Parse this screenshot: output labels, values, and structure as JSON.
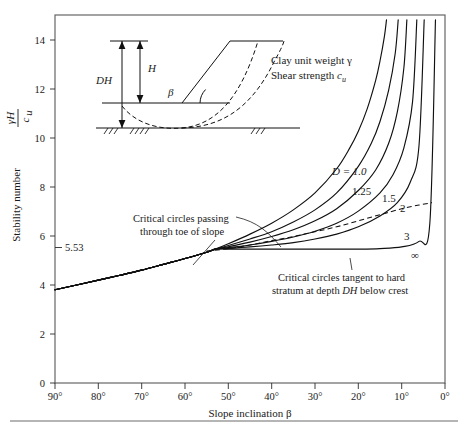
{
  "figure": {
    "kind": "taylor-slope-stability-chart",
    "background": "#ffffff",
    "frame_color": "#58585a",
    "curve_color": "#101010"
  },
  "axes": {
    "y_title_prefix": "Stability number",
    "y_title_numerator": "γH",
    "y_title_denominator": "c",
    "y_title_denominator_sub": "u",
    "x_title": "Slope inclination β",
    "y_ticks": [
      "0",
      "2",
      "4",
      "6",
      "8",
      "10",
      "12",
      "14"
    ],
    "y_tick_values": [
      0,
      2,
      4,
      6,
      8,
      10,
      12,
      14
    ],
    "y_range": [
      0,
      15.2
    ],
    "x_ticks": [
      "90°",
      "80°",
      "70°",
      "60°",
      "50°",
      "40°",
      "30°",
      "20°",
      "10°",
      "0°"
    ],
    "x_tick_values": [
      90,
      80,
      70,
      60,
      50,
      40,
      30,
      20,
      10,
      0
    ],
    "x_range": [
      90,
      0
    ],
    "x_reversed": true,
    "grid": false
  },
  "annotations": {
    "value_553": "5.53",
    "toe_note_line1": "Critical circles passing",
    "toe_note_line2": "through toe of slope",
    "tangent_note_line1": "Critical circles tangent to hard",
    "tangent_note_line2_a": "stratum at depth ",
    "tangent_note_line2_b": "DH",
    "tangent_note_line2_c": " below crest"
  },
  "inset": {
    "label_DH": "DH",
    "label_H": "H",
    "label_beta": "β",
    "text_line1": "Clay unit weight γ",
    "text_line2_a": "Shear strength ",
    "text_line2_b": "c",
    "text_line2_sub": "u"
  },
  "curve_labels": {
    "d1": "D = 1.0",
    "d125": "1.25",
    "d15": "1.5",
    "d2": "2",
    "d3": "3",
    "dinf": "∞"
  },
  "chart_data": {
    "type": "line",
    "title": "",
    "xlabel": "Slope inclination β",
    "ylabel": "Stability number γH/c_u",
    "xlim": [
      90,
      0
    ],
    "ylim": [
      0,
      15.2
    ],
    "x_reversed": true,
    "grid": false,
    "legend_position": "inline-curve-labels",
    "annotations": [
      {
        "text": "5.53",
        "x": 90,
        "y": 5.53,
        "note": "limiting stability number for deep circles"
      },
      {
        "text": "Critical circles passing through toe of slope",
        "x": 62,
        "y": 6.9
      },
      {
        "text": "Critical circles tangent to hard stratum at depth DH below crest",
        "x": 22,
        "y": 4.6
      }
    ],
    "series": [
      {
        "name": "D = 1.0",
        "label": "D = 1.0",
        "style": "solid",
        "x": [
          90,
          85,
          80,
          75,
          70,
          65,
          60,
          55,
          53,
          50,
          45,
          40,
          35,
          30,
          25,
          22,
          20,
          18,
          16,
          15,
          14,
          13.5
        ],
        "y": [
          3.85,
          4.05,
          4.25,
          4.45,
          4.66,
          4.9,
          5.14,
          5.4,
          5.53,
          5.75,
          6.15,
          6.6,
          7.15,
          7.85,
          8.85,
          9.7,
          10.4,
          11.3,
          12.5,
          13.3,
          14.3,
          15.0
        ]
      },
      {
        "name": "D = 1.25",
        "label": "1.25",
        "style": "solid",
        "x": [
          90,
          85,
          80,
          75,
          70,
          65,
          60,
          55,
          53,
          50,
          45,
          40,
          35,
          30,
          25,
          20,
          17,
          15,
          13,
          11.5,
          10.8
        ],
        "y": [
          3.85,
          4.05,
          4.25,
          4.45,
          4.66,
          4.9,
          5.14,
          5.4,
          5.53,
          5.68,
          5.95,
          6.25,
          6.65,
          7.15,
          7.85,
          8.95,
          9.9,
          10.8,
          12.1,
          13.6,
          15.0
        ]
      },
      {
        "name": "D = 1.5",
        "label": "1.5",
        "style": "solid",
        "x": [
          90,
          85,
          80,
          75,
          70,
          65,
          60,
          55,
          53,
          50,
          45,
          40,
          35,
          30,
          25,
          20,
          16,
          13,
          11,
          9.5,
          8.8
        ],
        "y": [
          3.85,
          4.05,
          4.25,
          4.45,
          4.66,
          4.9,
          5.14,
          5.4,
          5.53,
          5.63,
          5.82,
          6.05,
          6.33,
          6.7,
          7.2,
          7.95,
          8.8,
          9.9,
          11.2,
          13.0,
          15.0
        ]
      },
      {
        "name": "D = 2",
        "label": "2",
        "style": "solid",
        "x": [
          90,
          85,
          80,
          75,
          70,
          65,
          60,
          55,
          53,
          50,
          45,
          40,
          35,
          30,
          25,
          20,
          15,
          12,
          9.5,
          7.5,
          6.5
        ],
        "y": [
          3.85,
          4.05,
          4.25,
          4.45,
          4.66,
          4.9,
          5.14,
          5.4,
          5.53,
          5.59,
          5.7,
          5.85,
          6.03,
          6.27,
          6.6,
          7.1,
          7.85,
          8.6,
          9.7,
          11.6,
          15.0
        ]
      },
      {
        "name": "D = 3",
        "label": "3",
        "style": "solid",
        "x": [
          90,
          85,
          80,
          75,
          70,
          65,
          60,
          55,
          53,
          50,
          45,
          40,
          35,
          30,
          25,
          20,
          15,
          11,
          8,
          6,
          4.8
        ],
        "y": [
          3.85,
          4.05,
          4.25,
          4.45,
          4.66,
          4.9,
          5.14,
          5.4,
          5.53,
          5.56,
          5.62,
          5.7,
          5.8,
          5.95,
          6.15,
          6.45,
          6.9,
          7.45,
          8.3,
          9.8,
          15.0
        ]
      },
      {
        "name": "D = ∞",
        "label": "∞",
        "style": "solid",
        "x": [
          90,
          85,
          80,
          75,
          70,
          65,
          60,
          55,
          53,
          50,
          45,
          40,
          35,
          30,
          25,
          20,
          15,
          10,
          6,
          3.5,
          2.2
        ],
        "y": [
          3.85,
          4.05,
          4.25,
          4.45,
          4.66,
          4.9,
          5.14,
          5.4,
          5.53,
          5.53,
          5.53,
          5.53,
          5.53,
          5.53,
          5.53,
          5.53,
          5.55,
          5.62,
          5.85,
          6.6,
          15.0
        ]
      },
      {
        "name": "critical toe circle locus",
        "label": "",
        "style": "dashed",
        "x": [
          55,
          50,
          45,
          40,
          35,
          30,
          25,
          20,
          15,
          10,
          6,
          3
        ],
        "y": [
          5.45,
          5.55,
          5.7,
          5.88,
          6.05,
          6.25,
          6.45,
          6.7,
          6.95,
          7.2,
          7.35,
          7.45
        ]
      }
    ]
  }
}
